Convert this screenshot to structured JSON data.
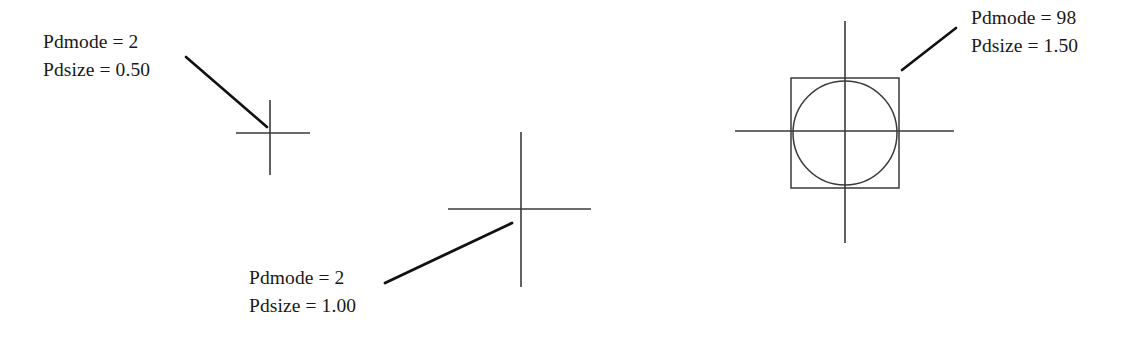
{
  "figure": {
    "background_color": "#ffffff",
    "stroke_color": "#3a3a3a",
    "leader_color": "#111111",
    "text_color": "#181818",
    "caption_font": "serif"
  },
  "annotations": [
    {
      "id": "left",
      "pdmode_label": "Pdmode = 2",
      "pdsize_label": "Pdsize = 0.50",
      "pdmode_value": 2,
      "pdsize_value": 0.5
    },
    {
      "id": "middle",
      "pdmode_label": "Pdmode = 2",
      "pdsize_label": "Pdsize = 1.00",
      "pdmode_value": 2,
      "pdsize_value": 1.0
    },
    {
      "id": "right",
      "pdmode_label": "Pdmode = 98",
      "pdsize_label": "Pdsize = 1.50",
      "pdmode_value": 98,
      "pdsize_value": 1.5
    }
  ],
  "glyphs": {
    "left_cross": {
      "name": "cross-point-marker-small",
      "center_x": 270,
      "center_y": 133,
      "h_x1": 236,
      "h_x2": 310,
      "v_y1": 100,
      "v_y2": 175
    },
    "middle_cross": {
      "name": "cross-point-marker-medium",
      "center_x": 521,
      "center_y": 209,
      "h_x1": 448,
      "h_x2": 591,
      "v_y1": 132,
      "v_y2": 287
    },
    "right_cross": {
      "name": "cross-point-marker-circle-square",
      "center_x": 845,
      "center_y": 131,
      "h_x1": 735,
      "h_x2": 954,
      "v_y1": 21,
      "v_y2": 243,
      "square_x": 791,
      "square_y": 78,
      "square_w": 108,
      "square_h": 110,
      "circle_cx": 845,
      "circle_cy": 133,
      "circle_r": 52
    },
    "leaders": [
      {
        "name": "leader-line-left",
        "x1": 186,
        "y1": 57,
        "x2": 267,
        "y2": 127
      },
      {
        "name": "leader-line-middle",
        "x1": 385,
        "y1": 283,
        "x2": 512,
        "y2": 223
      },
      {
        "name": "leader-line-right",
        "x1": 902,
        "y1": 70,
        "x2": 956,
        "y2": 28
      }
    ]
  }
}
